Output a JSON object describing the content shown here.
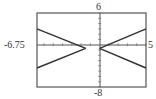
{
  "chart_data": {
    "type": "line",
    "title": "",
    "xlabel": "",
    "ylabel": "",
    "xlim": [
      -6.75,
      5
    ],
    "ylim": [
      -8,
      6
    ],
    "grid": false,
    "legend": null,
    "tick_labels": {
      "xmin": "-6.75",
      "xmax": "5",
      "ymax": "6",
      "ymin": "-8"
    },
    "x_tick_step": 1,
    "y_tick_step": 1,
    "series": [
      {
        "name": "left-branch-upper",
        "x": [
          -6.75,
          -1.5
        ],
        "y": [
          3.0,
          -0.7
        ]
      },
      {
        "name": "left-branch-lower",
        "x": [
          -1.5,
          -6.75
        ],
        "y": [
          -0.7,
          -4.4
        ]
      },
      {
        "name": "right-branch-upper",
        "x": [
          0.0,
          5.0
        ],
        "y": [
          -0.7,
          3.0
        ]
      },
      {
        "name": "right-branch-lower",
        "x": [
          0.0,
          5.0
        ],
        "y": [
          -0.7,
          -4.4
        ]
      }
    ]
  },
  "labels": {
    "xmin": "-6.75",
    "xmax": "5",
    "ymax": "6",
    "ymin": "-8"
  }
}
